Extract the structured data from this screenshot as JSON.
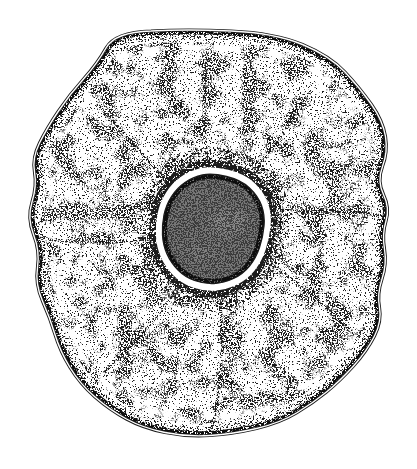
{
  "figure": {
    "alt": "Pen-and-ink stipple drawing of a single cell: irregular wavy membrane, stippled cytoplasm, and a large dark nucleus surrounded by a white halo and dense stippling"
  },
  "colors": {
    "background": "#ffffff",
    "ink": "#1a1a1a",
    "cytoplasm": "#ffffff",
    "nucleus": "#767676",
    "nucleus_rim": "#0f0f0f",
    "nuclear_halo": "#ffffff",
    "membrane_gap": "#ffffff"
  }
}
